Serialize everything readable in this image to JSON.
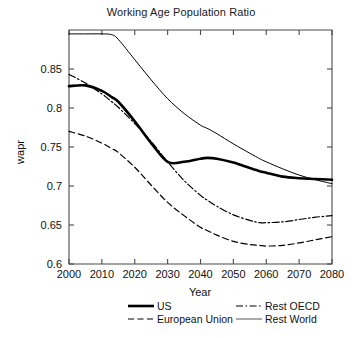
{
  "chart_data": {
    "type": "line",
    "title": "Working Age Population Ratio",
    "xlabel": "Year",
    "ylabel": "wapr",
    "xlim": [
      2000,
      2080
    ],
    "ylim": [
      0.6,
      0.9
    ],
    "xticks": [
      2000,
      2010,
      2020,
      2030,
      2040,
      2050,
      2060,
      2070,
      2080
    ],
    "xtick_labels": [
      "2000",
      "2010",
      "2020",
      "2030",
      "2040",
      "2050",
      "2060",
      "2070",
      "2080"
    ],
    "yticks": [
      0.6,
      0.65,
      0.7,
      0.75,
      0.8,
      0.85
    ],
    "ytick_labels": [
      "0.6",
      "0.65",
      "0.7",
      "0.75",
      "0.8",
      "0.85"
    ],
    "grid": false,
    "legend_position": "below-center",
    "x": [
      2000,
      2005,
      2010,
      2013,
      2015,
      2020,
      2025,
      2030,
      2035,
      2040,
      2042,
      2045,
      2050,
      2055,
      2058,
      2060,
      2065,
      2070,
      2075,
      2080
    ],
    "series": [
      {
        "name": "US",
        "style": "solid-thick",
        "linewidth": 2.6,
        "color": "#000000",
        "values": [
          0.828,
          0.829,
          0.822,
          0.814,
          0.808,
          0.783,
          0.755,
          0.731,
          0.731,
          0.735,
          0.736,
          0.735,
          0.73,
          0.723,
          0.719,
          0.717,
          0.712,
          0.71,
          0.709,
          0.708
        ]
      },
      {
        "name": "European Union",
        "style": "dashed",
        "linewidth": 1.2,
        "color": "#000000",
        "values": [
          0.77,
          0.764,
          0.755,
          0.748,
          0.743,
          0.724,
          0.701,
          0.679,
          0.662,
          0.647,
          0.643,
          0.637,
          0.629,
          0.625,
          0.624,
          0.623,
          0.624,
          0.627,
          0.631,
          0.635
        ]
      },
      {
        "name": "Rest OECD",
        "style": "dash-dot",
        "linewidth": 1.2,
        "color": "#000000",
        "values": [
          0.843,
          0.832,
          0.818,
          0.808,
          0.801,
          0.78,
          0.757,
          0.731,
          0.707,
          0.688,
          0.682,
          0.674,
          0.663,
          0.656,
          0.653,
          0.653,
          0.654,
          0.657,
          0.66,
          0.662
        ]
      },
      {
        "name": "Rest World",
        "style": "solid-thin",
        "linewidth": 1.0,
        "color": "#555555",
        "values": [
          0.895,
          0.895,
          0.895,
          0.894,
          0.888,
          0.862,
          0.836,
          0.812,
          0.793,
          0.778,
          0.774,
          0.767,
          0.754,
          0.742,
          0.735,
          0.731,
          0.722,
          0.714,
          0.708,
          0.703
        ]
      }
    ]
  },
  "legend": {
    "entries": [
      {
        "label": "US",
        "style": "solid-thick"
      },
      {
        "label": "European Union",
        "style": "dashed"
      },
      {
        "label": "Rest OECD",
        "style": "dash-dot"
      },
      {
        "label": "Rest World",
        "style": "solid-thin"
      }
    ]
  }
}
